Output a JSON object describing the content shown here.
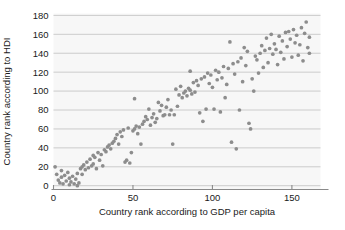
{
  "chart_data": {
    "type": "scatter",
    "title": "",
    "xlabel": "Country rank according to GDP per capita",
    "ylabel": "Country rank according to HDI",
    "xlim": [
      0,
      168
    ],
    "ylim": [
      -4,
      182
    ],
    "xticks": [
      0,
      50,
      100,
      150
    ],
    "yticks": [
      0,
      20,
      40,
      60,
      80,
      100,
      120,
      140,
      160,
      180
    ],
    "xtick_labels": [
      "0",
      "50",
      "100",
      "150"
    ],
    "ytick_labels": [
      "0",
      "20",
      "40",
      "60",
      "80",
      "100",
      "120",
      "140",
      "160",
      "180"
    ],
    "grid": "horizontal",
    "legend": "none",
    "marker_color": "#8d8d8d",
    "plot_background": "#f7f7f7",
    "gridline_color": "#b9b9b9",
    "axis_color": "#8a8a8a",
    "text_color": "#1a1a1a",
    "point_count": 168,
    "points": [
      [
        1,
        20
      ],
      [
        2,
        12
      ],
      [
        3,
        6
      ],
      [
        4,
        3
      ],
      [
        5,
        16
      ],
      [
        5,
        9
      ],
      [
        6,
        2
      ],
      [
        7,
        11
      ],
      [
        8,
        5
      ],
      [
        9,
        14
      ],
      [
        10,
        1
      ],
      [
        10,
        8
      ],
      [
        11,
        4
      ],
      [
        12,
        10
      ],
      [
        13,
        2
      ],
      [
        14,
        7
      ],
      [
        15,
        0
      ],
      [
        15,
        13
      ],
      [
        16,
        3
      ],
      [
        17,
        18
      ],
      [
        18,
        20
      ],
      [
        18,
        12
      ],
      [
        19,
        22
      ],
      [
        20,
        17
      ],
      [
        21,
        25
      ],
      [
        22,
        19
      ],
      [
        23,
        28
      ],
      [
        24,
        21
      ],
      [
        25,
        23
      ],
      [
        25,
        32
      ],
      [
        26,
        30
      ],
      [
        27,
        18
      ],
      [
        28,
        35
      ],
      [
        29,
        27
      ],
      [
        30,
        33
      ],
      [
        31,
        21
      ],
      [
        32,
        38
      ],
      [
        33,
        36
      ],
      [
        34,
        41
      ],
      [
        35,
        43
      ],
      [
        36,
        39
      ],
      [
        37,
        45
      ],
      [
        38,
        47
      ],
      [
        39,
        50
      ],
      [
        40,
        54
      ],
      [
        41,
        44
      ],
      [
        42,
        57
      ],
      [
        43,
        52
      ],
      [
        44,
        59
      ],
      [
        45,
        25
      ],
      [
        46,
        27
      ],
      [
        47,
        61
      ],
      [
        48,
        24
      ],
      [
        49,
        35
      ],
      [
        50,
        58
      ],
      [
        51,
        60
      ],
      [
        51,
        92
      ],
      [
        52,
        63
      ],
      [
        53,
        55
      ],
      [
        54,
        62
      ],
      [
        55,
        44
      ],
      [
        56,
        65
      ],
      [
        57,
        68
      ],
      [
        58,
        73
      ],
      [
        59,
        70
      ],
      [
        60,
        81
      ],
      [
        61,
        64
      ],
      [
        62,
        72
      ],
      [
        63,
        76
      ],
      [
        64,
        67
      ],
      [
        65,
        71
      ],
      [
        66,
        88
      ],
      [
        67,
        79
      ],
      [
        68,
        85
      ],
      [
        69,
        74
      ],
      [
        70,
        75
      ],
      [
        71,
        83
      ],
      [
        72,
        91
      ],
      [
        73,
        75
      ],
      [
        74,
        80
      ],
      [
        75,
        44
      ],
      [
        76,
        75
      ],
      [
        77,
        102
      ],
      [
        78,
        84
      ],
      [
        79,
        96
      ],
      [
        80,
        105
      ],
      [
        81,
        93
      ],
      [
        82,
        98
      ],
      [
        83,
        100
      ],
      [
        84,
        95
      ],
      [
        85,
        103
      ],
      [
        86,
        101
      ],
      [
        86,
        121
      ],
      [
        87,
        97
      ],
      [
        88,
        109
      ],
      [
        89,
        99
      ],
      [
        90,
        111
      ],
      [
        91,
        106
      ],
      [
        92,
        77
      ],
      [
        93,
        113
      ],
      [
        94,
        68
      ],
      [
        95,
        115
      ],
      [
        96,
        81
      ],
      [
        97,
        119
      ],
      [
        98,
        108
      ],
      [
        99,
        117
      ],
      [
        100,
        104
      ],
      [
        101,
        81
      ],
      [
        102,
        122
      ],
      [
        103,
        112
      ],
      [
        104,
        120
      ],
      [
        105,
        78
      ],
      [
        106,
        114
      ],
      [
        107,
        126
      ],
      [
        108,
        93
      ],
      [
        109,
        107
      ],
      [
        110,
        124
      ],
      [
        111,
        152
      ],
      [
        112,
        46
      ],
      [
        113,
        129
      ],
      [
        114,
        118
      ],
      [
        115,
        39
      ],
      [
        116,
        131
      ],
      [
        117,
        80
      ],
      [
        118,
        135
      ],
      [
        119,
        110
      ],
      [
        120,
        146
      ],
      [
        121,
        127
      ],
      [
        122,
        142
      ],
      [
        123,
        66
      ],
      [
        124,
        60
      ],
      [
        125,
        113
      ],
      [
        126,
        100
      ],
      [
        127,
        137
      ],
      [
        128,
        133
      ],
      [
        129,
        119
      ],
      [
        130,
        140
      ],
      [
        131,
        148
      ],
      [
        132,
        125
      ],
      [
        133,
        143
      ],
      [
        134,
        156
      ],
      [
        135,
        130
      ],
      [
        136,
        145
      ],
      [
        137,
        160
      ],
      [
        138,
        139
      ],
      [
        139,
        150
      ],
      [
        140,
        144
      ],
      [
        141,
        128
      ],
      [
        142,
        158
      ],
      [
        143,
        141
      ],
      [
        144,
        153
      ],
      [
        145,
        134
      ],
      [
        146,
        162
      ],
      [
        147,
        147
      ],
      [
        148,
        163
      ],
      [
        149,
        155
      ],
      [
        150,
        136
      ],
      [
        151,
        165
      ],
      [
        152,
        151
      ],
      [
        153,
        159
      ],
      [
        154,
        138
      ],
      [
        155,
        149
      ],
      [
        156,
        167
      ],
      [
        157,
        132
      ],
      [
        158,
        161
      ],
      [
        159,
        173
      ],
      [
        160,
        146
      ],
      [
        161,
        157
      ],
      [
        161,
        140
      ]
    ]
  }
}
